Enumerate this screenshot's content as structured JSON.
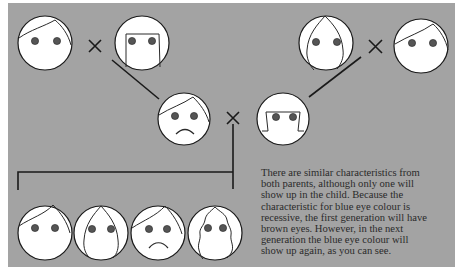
{
  "figure": {
    "background_color": "#a3a3a3",
    "face_color": "#ffffff",
    "eye_color": "#555555",
    "line_color": "#1a1a1a",
    "cross_symbol": "×"
  },
  "generations": {
    "grandparents": [
      {
        "id": "grandparent-1",
        "hair": "short-fringe",
        "eyes": "brown",
        "expression": "neutral"
      },
      {
        "id": "grandparent-2",
        "hair": "straight-bob",
        "eyes": "brown",
        "expression": "neutral"
      },
      {
        "id": "grandparent-3",
        "hair": "long-parted",
        "eyes": "brown",
        "expression": "neutral"
      },
      {
        "id": "grandparent-4",
        "hair": "short-fringe",
        "eyes": "brown",
        "expression": "neutral"
      }
    ],
    "parents": [
      {
        "id": "parent-1",
        "hair": "short-fringe",
        "eyes": "brown",
        "expression": "sad"
      },
      {
        "id": "parent-2",
        "hair": "flipped-bob",
        "eyes": "brown",
        "expression": "neutral"
      }
    ],
    "children": [
      {
        "id": "child-1",
        "hair": "short-fringe",
        "eyes": "brown",
        "expression": "neutral"
      },
      {
        "id": "child-2",
        "hair": "long-parted",
        "eyes": "brown",
        "expression": "neutral"
      },
      {
        "id": "child-3",
        "hair": "short-fringe",
        "eyes": "brown",
        "expression": "sad"
      },
      {
        "id": "child-4",
        "hair": "wavy-long",
        "eyes": "brown",
        "expression": "neutral"
      }
    ]
  },
  "caption": {
    "lines": [
      "There are similar characteristics from",
      "both parents, although only one will",
      "show up in the child. Because the",
      "characteristic for blue eye colour is",
      "recessive, the first generation will have",
      "brown eyes. However, in the next",
      "generation the blue eye colour will",
      "show up again, as you can see."
    ]
  }
}
